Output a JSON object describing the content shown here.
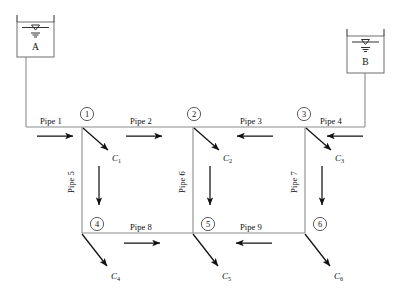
{
  "diagram": {
    "colors": {
      "pipe": "#8c8c8c",
      "arrow": "#111111",
      "node_stroke": "#4a4a4a",
      "reservoir_stroke": "#6e6e6e",
      "background": "#ffffff"
    }
  },
  "reservoirs": [
    {
      "id": "A",
      "label": "A",
      "water_level_icon": "water-surface-symbol"
    },
    {
      "id": "B",
      "label": "B",
      "water_level_icon": "water-surface-symbol"
    }
  ],
  "nodes": [
    {
      "id": "1",
      "label": "1"
    },
    {
      "id": "2",
      "label": "2"
    },
    {
      "id": "3",
      "label": "3"
    },
    {
      "id": "4",
      "label": "4"
    },
    {
      "id": "5",
      "label": "5"
    },
    {
      "id": "6",
      "label": "6"
    }
  ],
  "pipes": [
    {
      "id": "1",
      "label": "Pipe 1",
      "orientation": "horizontal",
      "flow_direction": "right"
    },
    {
      "id": "2",
      "label": "Pipe 2",
      "orientation": "horizontal",
      "flow_direction": "right"
    },
    {
      "id": "3",
      "label": "Pipe 3",
      "orientation": "horizontal",
      "flow_direction": "left"
    },
    {
      "id": "4",
      "label": "Pipe 4",
      "orientation": "horizontal",
      "flow_direction": "left"
    },
    {
      "id": "5",
      "label": "Pipe 5",
      "orientation": "vertical",
      "flow_direction": "down"
    },
    {
      "id": "6",
      "label": "Pipe 6",
      "orientation": "vertical",
      "flow_direction": "down"
    },
    {
      "id": "7",
      "label": "Pipe 7",
      "orientation": "vertical",
      "flow_direction": "down"
    },
    {
      "id": "8",
      "label": "Pipe 8",
      "orientation": "horizontal",
      "flow_direction": "right"
    },
    {
      "id": "9",
      "label": "Pipe 9",
      "orientation": "horizontal",
      "flow_direction": "left"
    }
  ],
  "demands": [
    {
      "id": "C1",
      "symbol": "C",
      "subscript": "1",
      "at_node": "1"
    },
    {
      "id": "C2",
      "symbol": "C",
      "subscript": "2",
      "at_node": "2"
    },
    {
      "id": "C3",
      "symbol": "C",
      "subscript": "3",
      "at_node": "3"
    },
    {
      "id": "C4",
      "symbol": "C",
      "subscript": "4",
      "at_node": "4"
    },
    {
      "id": "C5",
      "symbol": "C",
      "subscript": "5",
      "at_node": "5"
    },
    {
      "id": "C6",
      "symbol": "C",
      "subscript": "6",
      "at_node": "6"
    }
  ]
}
